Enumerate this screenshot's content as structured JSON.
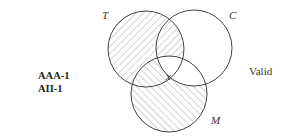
{
  "forms": [
    "AAA-1",
    "AII-1"
  ],
  "verdict": "Valid",
  "circles": {
    "T": {
      "label": "T",
      "cx": 146,
      "cy": 49,
      "r": 38
    },
    "C": {
      "label": "C",
      "cx": 194,
      "cy": 48,
      "r": 38
    },
    "M": {
      "label": "M",
      "cx": 169,
      "cy": 94,
      "r": 38
    }
  },
  "center_mark": "x",
  "colors": {
    "stroke": "#444444",
    "hatch": "#9a9a9a"
  }
}
